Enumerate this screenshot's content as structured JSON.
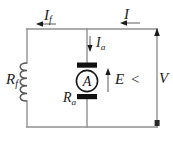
{
  "figure": {
    "kind": "dc-motor-equivalent-circuit-diagram",
    "colors": {
      "wire": "#8f8f8f",
      "ink": "#1a1a1a",
      "brush": "#111111",
      "background": "#ffffff"
    }
  },
  "labels": {
    "field_current": {
      "symbol": "I",
      "subscript": "f",
      "text": "If"
    },
    "line_current": {
      "symbol": "I",
      "subscript": "",
      "text": "I"
    },
    "armature_current": {
      "symbol": "I",
      "subscript": "a",
      "text": "Ia"
    },
    "field_resistance": {
      "symbol": "R",
      "subscript": "f",
      "text": "Rf"
    },
    "armature_resistance": {
      "symbol": "R",
      "subscript": "a",
      "text": "Ra"
    },
    "back_emf": {
      "symbol": "E",
      "subscript": "",
      "text": "E"
    },
    "relation": {
      "text": "<"
    },
    "terminal_voltage": {
      "symbol": "V",
      "subscript": "",
      "text": "V"
    }
  },
  "components": {
    "armature": {
      "glyph": "A",
      "name": "armature-circle"
    },
    "field_winding": {
      "name": "field-coil",
      "turns": 5
    }
  },
  "arrows": {
    "field_current": {
      "direction": "left"
    },
    "line_current": {
      "direction": "left"
    },
    "armature_current": {
      "direction": "down"
    },
    "back_emf": {
      "direction": "up"
    },
    "terminal_voltage": {
      "direction": "up"
    }
  }
}
